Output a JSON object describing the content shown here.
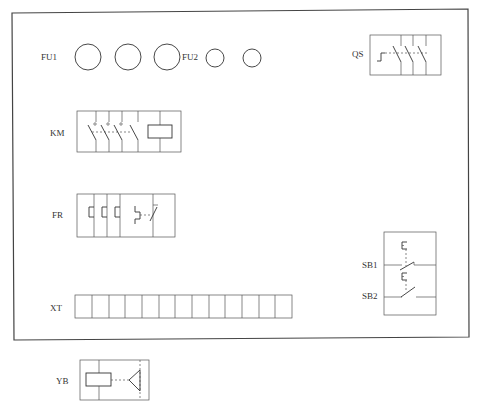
{
  "diagram": {
    "type": "electrical-panel-layout",
    "components": [
      {
        "id": "FU1",
        "label": "FU1",
        "kind": "fuse",
        "count": 3
      },
      {
        "id": "FU2",
        "label": "FU2",
        "kind": "fuse",
        "count": 2
      },
      {
        "id": "QS",
        "label": "QS",
        "kind": "three-pole-isolating-switch"
      },
      {
        "id": "KM",
        "label": "KM",
        "kind": "contactor",
        "main_contacts": 3,
        "aux_contacts": 1,
        "coil": true
      },
      {
        "id": "FR",
        "label": "FR",
        "kind": "thermal-overload-relay",
        "heating_elements": 3,
        "nc_contact": 1
      },
      {
        "id": "SB1",
        "label": "SB1",
        "kind": "push-button-nc"
      },
      {
        "id": "SB2",
        "label": "SB2",
        "kind": "push-button-no"
      },
      {
        "id": "XT",
        "label": "XT",
        "kind": "terminal-block",
        "terminals": 13
      },
      {
        "id": "YB",
        "label": "YB",
        "kind": "electromagnetic-brake"
      }
    ]
  },
  "labels": {
    "fu1": "FU1",
    "fu2": "FU2",
    "qs": "QS",
    "km": "KM",
    "fr": "FR",
    "sb1": "SB1",
    "sb2": "SB2",
    "xt": "XT",
    "yb": "YB"
  }
}
